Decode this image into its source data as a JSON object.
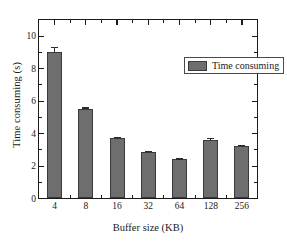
{
  "chart_data": {
    "type": "bar",
    "title": "",
    "xlabel": "Buffer size (KB)",
    "ylabel": "Time consuming (s)",
    "categories": [
      "4",
      "8",
      "16",
      "32",
      "64",
      "128",
      "256"
    ],
    "values": [
      9.0,
      5.5,
      3.7,
      2.85,
      2.4,
      3.55,
      3.2
    ],
    "errors": [
      0.35,
      0.12,
      0.12,
      0.1,
      0.08,
      0.18,
      0.13
    ],
    "series": [
      {
        "name": "Time consuming",
        "values": [
          9.0,
          5.5,
          3.7,
          2.85,
          2.4,
          3.55,
          3.2
        ]
      }
    ],
    "ylim": [
      0,
      11
    ],
    "y_major_ticks": [
      0,
      2,
      4,
      6,
      8,
      10
    ],
    "y_tick_labels": [
      "0",
      "2",
      "4",
      "6",
      "8",
      "10"
    ],
    "y_minor_step": 0.5,
    "grid": false,
    "legend": {
      "position": "top-right",
      "entries": [
        "Time consuming"
      ]
    },
    "bar_color": "#6e6e6e",
    "bar_edge_color": "#3a3a3a",
    "axis_color": "#1a1a1a",
    "background_color": "#ffffff"
  },
  "legend": {
    "label": "Time consuming"
  },
  "axes": {
    "x_title": "Buffer size (KB)",
    "y_title": "Time consuming (s)"
  }
}
